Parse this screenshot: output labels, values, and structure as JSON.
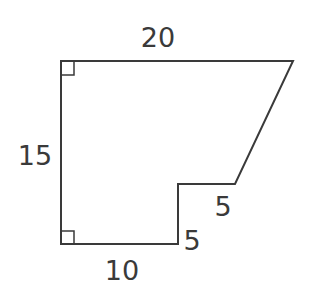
{
  "diagram": {
    "type": "composite-polygon",
    "stroke_color": "#3a3a3a",
    "labels": {
      "top": "20",
      "left": "15",
      "bottom": "10",
      "step_vertical": "5",
      "step_horizontal": "5"
    },
    "right_angle_markers": [
      "top-left",
      "bottom-left"
    ]
  }
}
